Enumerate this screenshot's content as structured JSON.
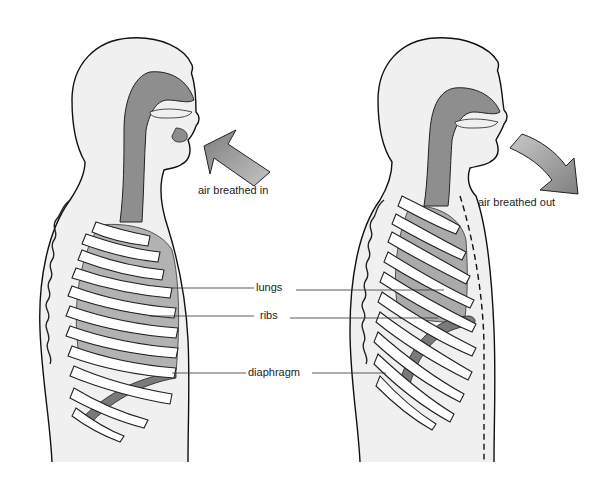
{
  "diagram": {
    "type": "anatomical-comparison",
    "panels": [
      {
        "id": "inhale",
        "side": "left",
        "state": "air breathed in"
      },
      {
        "id": "exhale",
        "side": "right",
        "state": "air breathed out"
      }
    ],
    "labels": {
      "air_in": "air breathed in",
      "air_out": "air breathed out",
      "lungs": "lungs",
      "ribs": "ribs",
      "diaphragm": "diaphragm"
    },
    "colors": {
      "body_fill": "#efefef",
      "airway_fill": "#8c8c8c",
      "lung_fill": "#b0b0b0",
      "outline": "#111111",
      "arrow_fill": "#9a9a9a"
    }
  }
}
